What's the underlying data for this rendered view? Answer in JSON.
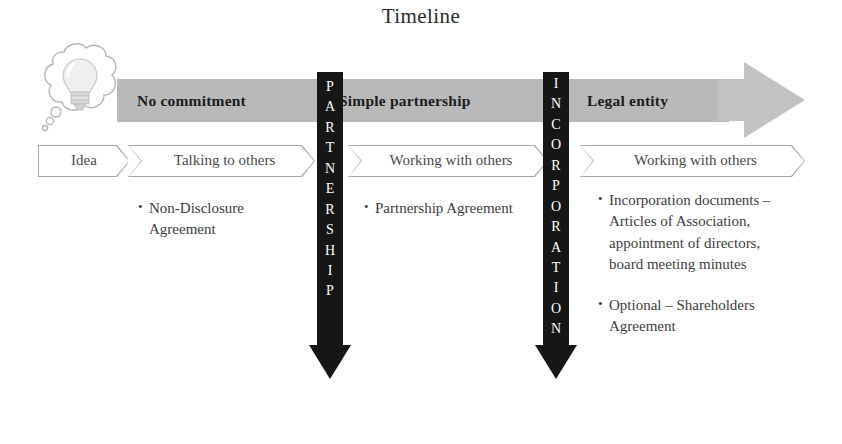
{
  "title": "Timeline",
  "idea_icon": {
    "bubble_name": "thought-bubble",
    "lamp_name": "lightbulb-icon"
  },
  "phase_band": {
    "phases": [
      {
        "label": "No commitment",
        "left": 20,
        "name": "phase-no-commitment"
      },
      {
        "label": "Simple partnership",
        "left": 222,
        "name": "phase-simple-partnership"
      },
      {
        "label": "Legal entity",
        "left": 470,
        "name": "phase-legal-entity"
      }
    ]
  },
  "stages": [
    {
      "label": "Idea",
      "left": 38,
      "width": 92,
      "name": "stage-idea"
    },
    {
      "label": "Talking to others",
      "left": 128,
      "width": 187,
      "name": "stage-talking-to-others"
    },
    {
      "label": "Working with others",
      "left": 348,
      "width": 200,
      "name": "stage-working-with-others-partnership"
    },
    {
      "label": "Working with others",
      "left": 580,
      "width": 225,
      "name": "stage-working-with-others-legal-entity"
    }
  ],
  "vertical_arrows": [
    {
      "label": "PARTNERSHIP",
      "letters": [
        "P",
        "A",
        "R",
        "T",
        "N",
        "E",
        "R",
        "S",
        "H",
        "I",
        "P"
      ],
      "left": 317,
      "top": 72,
      "shaft_height": 273,
      "name": "vertical-arrow-partnership"
    },
    {
      "label": "INCORPORATION",
      "letters": [
        "I",
        "N",
        "C",
        "O",
        "R",
        "P",
        "O",
        "R",
        "A",
        "T",
        "I",
        "O",
        "N"
      ],
      "left": 543,
      "top": 72,
      "shaft_height": 273,
      "name": "vertical-arrow-incorporation"
    }
  ],
  "columns": [
    {
      "name": "bullets-no-commitment",
      "left": 138,
      "top": 198,
      "width": 165,
      "items": [
        "Non-Disclosure Agreement"
      ]
    },
    {
      "name": "bullets-simple-partnership",
      "left": 364,
      "top": 198,
      "width": 165,
      "items": [
        "Partnership Agreement"
      ]
    },
    {
      "name": "bullets-legal-entity",
      "left": 598,
      "top": 190,
      "width": 196,
      "items": [
        "Incorporation documents – Articles of Association, appointment of directors, board meeting minutes",
        "Optional – Shareholders Agreement"
      ]
    }
  ],
  "colors": {
    "band_body": "#b9b9b9",
    "band_head": "#c2c2c2",
    "arrow_black": "#161616",
    "chevron_outline": "#a9a9a9",
    "text": "#3d3d3d"
  }
}
